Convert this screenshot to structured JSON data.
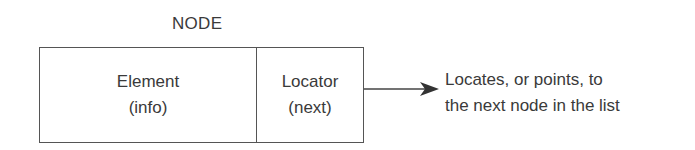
{
  "diagram": {
    "title": "NODE",
    "cells": [
      {
        "label": "Element",
        "sublabel": "(info)"
      },
      {
        "label": "Locator",
        "sublabel": "(next)"
      }
    ],
    "arrow": {
      "from": "Locator",
      "direction": "right"
    },
    "description": {
      "line1": "Locates, or points, to",
      "line2": "the next node in the list"
    }
  }
}
